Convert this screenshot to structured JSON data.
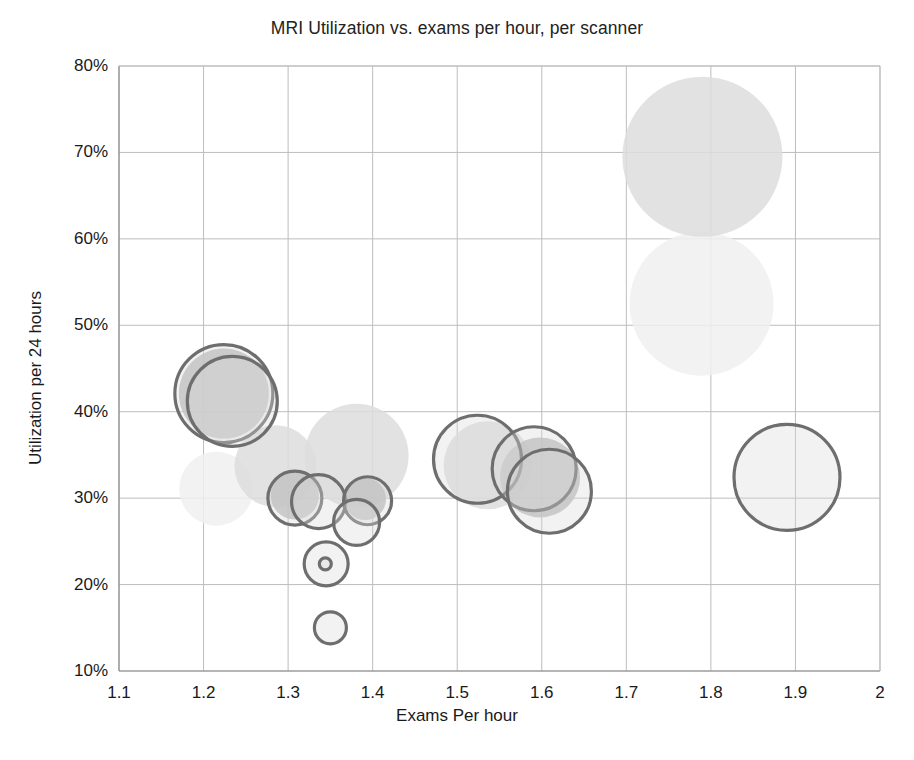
{
  "chart_data": {
    "type": "scatter",
    "title": "MRI Utilization vs. exams per hour, per scanner",
    "xlabel": "Exams Per hour",
    "ylabel": "Utilization per 24 hours",
    "xlim": [
      1.1,
      2.0
    ],
    "ylim": [
      0.1,
      0.8
    ],
    "xticks": [
      "1.1",
      "1.2",
      "1.3",
      "1.4",
      "1.5",
      "1.6",
      "1.7",
      "1.8",
      "1.9",
      "2"
    ],
    "xtick_values": [
      1.1,
      1.2,
      1.3,
      1.4,
      1.5,
      1.6,
      1.7,
      1.8,
      1.9,
      2.0
    ],
    "yticks": [
      "10%",
      "20%",
      "30%",
      "40%",
      "50%",
      "60%",
      "70%",
      "80%"
    ],
    "ytick_values": [
      0.1,
      0.2,
      0.3,
      0.4,
      0.5,
      0.6,
      0.7,
      0.8
    ],
    "grid": true,
    "legend": "none",
    "series": [
      {
        "name": "outlined-bubbles",
        "style": "stroked",
        "stroke": "#6e6e6e",
        "fill": "#d9d9d9",
        "points": [
          {
            "label": "bubble-1",
            "x": 1.224,
            "y": 0.421,
            "r": 49
          },
          {
            "label": "bubble-2",
            "x": 1.234,
            "y": 0.412,
            "r": 45
          },
          {
            "label": "bubble-3",
            "x": 1.308,
            "y": 0.3,
            "r": 27
          },
          {
            "label": "bubble-4",
            "x": 1.336,
            "y": 0.296,
            "r": 27
          },
          {
            "label": "bubble-5",
            "x": 1.394,
            "y": 0.297,
            "r": 24
          },
          {
            "label": "bubble-6",
            "x": 1.381,
            "y": 0.272,
            "r": 23
          },
          {
            "label": "bubble-7",
            "x": 1.345,
            "y": 0.224,
            "r": 22
          },
          {
            "label": "bubble-8",
            "x": 1.344,
            "y": 0.224,
            "r": 6
          },
          {
            "label": "bubble-9",
            "x": 1.35,
            "y": 0.15,
            "r": 16
          },
          {
            "label": "bubble-10",
            "x": 1.524,
            "y": 0.345,
            "r": 44
          },
          {
            "label": "bubble-11",
            "x": 1.591,
            "y": 0.334,
            "r": 42
          },
          {
            "label": "bubble-12",
            "x": 1.609,
            "y": 0.308,
            "r": 42
          },
          {
            "label": "bubble-13",
            "x": 1.89,
            "y": 0.324,
            "r": 53
          }
        ]
      },
      {
        "name": "filled-bubbles-mid",
        "style": "filled",
        "fill": "#b8b8b8",
        "points": [
          {
            "label": "fill-1",
            "x": 1.224,
            "y": 0.421,
            "r": 45
          },
          {
            "label": "fill-2",
            "x": 1.308,
            "y": 0.303,
            "r": 24
          },
          {
            "label": "fill-3",
            "x": 1.391,
            "y": 0.299,
            "r": 21
          },
          {
            "label": "fill-4",
            "x": 1.598,
            "y": 0.324,
            "r": 40
          }
        ]
      },
      {
        "name": "filled-bubbles-light",
        "style": "filled",
        "fill": "#dddddd",
        "points": [
          {
            "label": "ghost-1",
            "x": 1.285,
            "y": 0.337,
            "r": 41
          },
          {
            "label": "ghost-2",
            "x": 1.381,
            "y": 0.349,
            "r": 52
          },
          {
            "label": "ghost-3",
            "x": 1.536,
            "y": 0.338,
            "r": 44
          },
          {
            "label": "ghost-4",
            "x": 1.79,
            "y": 0.695,
            "r": 80
          }
        ]
      },
      {
        "name": "filled-bubbles-faint",
        "style": "filled",
        "fill": "#f0f0f0",
        "points": [
          {
            "label": "faint-1",
            "x": 1.215,
            "y": 0.311,
            "r": 37
          },
          {
            "label": "faint-2",
            "x": 1.789,
            "y": 0.525,
            "r": 72
          }
        ]
      }
    ]
  },
  "colors": {
    "stroke": "#6e6e6e",
    "grid": "#bdbdbd",
    "axis": "#8c8c8c",
    "text": "#1a1a1a"
  }
}
